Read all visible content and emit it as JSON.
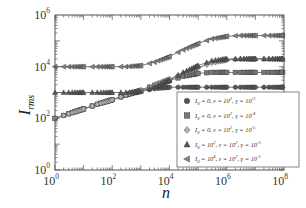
{
  "chart_data": {
    "type": "line",
    "title": "",
    "xlabel": "n",
    "ylabel": "I",
    "ylabel_subscript": "rms",
    "xscale": "log",
    "yscale": "log",
    "xlim": [
      1,
      100000000
    ],
    "ylim": [
      1,
      1000000
    ],
    "x_ticks": [
      {
        "base": "10",
        "exp": "0"
      },
      {
        "base": "10",
        "exp": "2"
      },
      {
        "base": "10",
        "exp": "4"
      },
      {
        "base": "10",
        "exp": "6"
      },
      {
        "base": "10",
        "exp": "8"
      }
    ],
    "y_ticks": [
      {
        "base": "10",
        "exp": "0"
      },
      {
        "base": "10",
        "exp": "2"
      },
      {
        "base": "10",
        "exp": "4"
      },
      {
        "base": "10",
        "exp": "6"
      }
    ],
    "grid": false,
    "legend_position": "lower right",
    "x": [
      1,
      3,
      10,
      30,
      100,
      300,
      1000,
      3000,
      10000,
      30000,
      100000,
      300000,
      1000000,
      3000000,
      10000000,
      30000000,
      100000000
    ],
    "series": [
      {
        "name": "I_0 = 0, ε = 10^2, γ = 10^-3",
        "legend": {
          "i0": "0",
          "eps": "2",
          "gamma": "-3",
          "i0_is_power": false
        },
        "marker": "circle",
        "color": "#555555",
        "values": [
          100,
          150,
          230,
          350,
          520,
          780,
          1100,
          1400,
          1600,
          1600,
          1600,
          1600,
          1600,
          1600,
          1600,
          1600,
          1600
        ]
      },
      {
        "name": "I_0 = 0, ε = 10^2, γ = 10^-4",
        "legend": {
          "i0": "0",
          "eps": "2",
          "gamma": "-4",
          "i0_is_power": false
        },
        "marker": "square",
        "color": "#777777",
        "values": [
          100,
          150,
          230,
          350,
          520,
          800,
          1200,
          1900,
          2900,
          4200,
          5500,
          6000,
          6000,
          6000,
          6000,
          6000,
          6000
        ]
      },
      {
        "name": "I_0 = 0, ε = 10^2, γ = 10^-5",
        "legend": {
          "i0": "0",
          "eps": "2",
          "gamma": "-5",
          "i0_is_power": false
        },
        "marker": "diamond",
        "color": "#b0b0b0",
        "values": [
          100,
          150,
          230,
          350,
          520,
          800,
          1250,
          2000,
          3300,
          5500,
          9000,
          14000,
          18000,
          20000,
          20000,
          20000,
          20000
        ]
      },
      {
        "name": "I_0 = 10^3, ε = 10^2, γ = 10^-5",
        "legend": {
          "i0": "3",
          "eps": "2",
          "gamma": "-5",
          "i0_is_power": true
        },
        "marker": "triangle-up",
        "color": "#555555",
        "values": [
          1000,
          1000,
          1000,
          1000,
          1000,
          1000,
          1100,
          1700,
          3000,
          6000,
          11000,
          17000,
          20000,
          20000,
          20000,
          20000,
          20000
        ]
      },
      {
        "name": "I_0 = 10^4, ε = 10^2, γ = 10^-5",
        "legend": {
          "i0": "4",
          "eps": "2",
          "gamma": "-5",
          "i0_is_power": true
        },
        "marker": "triangle-left",
        "color": "#808080",
        "values": [
          10000,
          10000,
          10000,
          10000,
          10000,
          10000,
          11000,
          15000,
          25000,
          45000,
          80000,
          120000,
          150000,
          160000,
          160000,
          160000,
          160000
        ]
      }
    ]
  }
}
